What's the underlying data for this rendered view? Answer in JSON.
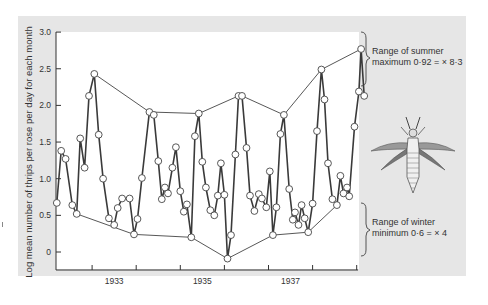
{
  "chart_data": {
    "type": "line",
    "title": "",
    "ylabel": "Log mean number of thrips per rose per day for each month",
    "xlabel": "",
    "ylim": [
      -0.2,
      3.0
    ],
    "yticks": [
      "0",
      "0.5",
      "1.0",
      "1.5",
      "2.0",
      "2.5",
      "3.0"
    ],
    "xtick_labels": [
      "1933",
      "1935",
      "1937"
    ],
    "grid": false,
    "series": [
      {
        "name": "Monthly log mean thrips",
        "points": [
          [
            1932.2,
            0.67
          ],
          [
            1932.3,
            1.38
          ],
          [
            1932.4,
            1.27
          ],
          [
            1932.55,
            0.64
          ],
          [
            1932.65,
            0.52
          ],
          [
            1932.73,
            1.55
          ],
          [
            1932.83,
            1.15
          ],
          [
            1932.93,
            2.13
          ],
          [
            1933.05,
            2.43
          ],
          [
            1933.15,
            1.6
          ],
          [
            1933.25,
            1.0
          ],
          [
            1933.38,
            0.46
          ],
          [
            1933.5,
            0.37
          ],
          [
            1933.58,
            0.6
          ],
          [
            1933.68,
            0.73
          ],
          [
            1933.85,
            0.73
          ],
          [
            1933.95,
            0.24
          ],
          [
            1934.03,
            0.45
          ],
          [
            1934.13,
            1.01
          ],
          [
            1934.3,
            1.91
          ],
          [
            1934.4,
            1.87
          ],
          [
            1934.5,
            1.24
          ],
          [
            1934.58,
            0.72
          ],
          [
            1934.65,
            0.88
          ],
          [
            1934.72,
            0.8
          ],
          [
            1934.82,
            1.15
          ],
          [
            1934.9,
            1.43
          ],
          [
            1935.0,
            0.83
          ],
          [
            1935.08,
            0.55
          ],
          [
            1935.15,
            0.65
          ],
          [
            1935.25,
            0.2
          ],
          [
            1935.33,
            1.58
          ],
          [
            1935.42,
            1.89
          ],
          [
            1935.5,
            1.23
          ],
          [
            1935.58,
            0.88
          ],
          [
            1935.68,
            0.57
          ],
          [
            1935.77,
            0.5
          ],
          [
            1935.85,
            0.77
          ],
          [
            1935.92,
            1.21
          ],
          [
            1936.0,
            0.78
          ],
          [
            1936.07,
            -0.09
          ],
          [
            1936.15,
            0.23
          ],
          [
            1936.25,
            1.33
          ],
          [
            1936.32,
            2.13
          ],
          [
            1936.4,
            2.13
          ],
          [
            1936.5,
            1.42
          ],
          [
            1936.58,
            0.77
          ],
          [
            1936.68,
            0.56
          ],
          [
            1936.78,
            0.79
          ],
          [
            1936.85,
            0.73
          ],
          [
            1936.95,
            0.61
          ],
          [
            1937.03,
            1.1
          ],
          [
            1937.1,
            0.23
          ],
          [
            1937.18,
            0.61
          ],
          [
            1937.27,
            1.61
          ],
          [
            1937.35,
            1.87
          ],
          [
            1937.47,
            0.86
          ],
          [
            1937.55,
            0.44
          ],
          [
            1937.6,
            0.54
          ],
          [
            1937.68,
            0.37
          ],
          [
            1937.75,
            0.64
          ],
          [
            1937.82,
            0.46
          ],
          [
            1937.9,
            0.27
          ],
          [
            1938.0,
            0.66
          ],
          [
            1938.1,
            1.65
          ],
          [
            1938.2,
            2.49
          ],
          [
            1938.27,
            2.08
          ],
          [
            1938.35,
            1.21
          ],
          [
            1938.45,
            0.72
          ],
          [
            1938.55,
            0.64
          ],
          [
            1938.63,
            1.04
          ],
          [
            1938.7,
            0.8
          ],
          [
            1938.78,
            0.88
          ],
          [
            1938.83,
            0.76
          ],
          [
            1938.95,
            1.71
          ],
          [
            1939.05,
            2.19
          ],
          [
            1939.1,
            2.77
          ],
          [
            1939.17,
            2.13
          ]
        ]
      },
      {
        "name": "Summer maxima envelope",
        "points": [
          [
            1933.05,
            2.43
          ],
          [
            1934.3,
            1.91
          ],
          [
            1935.42,
            1.89
          ],
          [
            1936.32,
            2.13
          ],
          [
            1936.4,
            2.13
          ],
          [
            1937.35,
            1.87
          ],
          [
            1938.2,
            2.49
          ],
          [
            1939.1,
            2.77
          ]
        ]
      },
      {
        "name": "Winter minima envelope",
        "points": [
          [
            1932.65,
            0.52
          ],
          [
            1933.95,
            0.24
          ],
          [
            1935.25,
            0.2
          ],
          [
            1936.07,
            -0.09
          ],
          [
            1937.1,
            0.23
          ],
          [
            1937.9,
            0.27
          ],
          [
            1938.55,
            0.64
          ]
        ]
      }
    ],
    "annotations": [
      {
        "text_line1": "Range of summer",
        "text_line2": "maximum 0·92 = × 8·3"
      },
      {
        "text_line1": "Range of winter",
        "text_line2": "minimum 0·6 = × 4"
      }
    ],
    "illustration": "thrips-insect"
  }
}
